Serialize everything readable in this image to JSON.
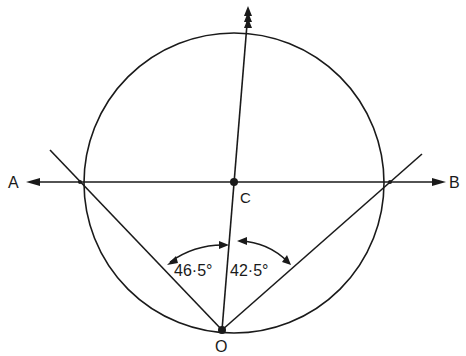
{
  "diagram": {
    "type": "geometry",
    "labels": {
      "A": "A",
      "B": "B",
      "C": "C",
      "O": "O"
    },
    "angles": {
      "left": "46·5°",
      "right": "42·5°"
    },
    "colors": {
      "ink": "#1a1a1a",
      "background": "#ffffff"
    },
    "elements": [
      {
        "kind": "circle",
        "name": "circle",
        "center": "C"
      },
      {
        "kind": "line",
        "name": "horizontal-line-AB",
        "from": "A",
        "to": "B"
      },
      {
        "kind": "line",
        "name": "line-O-through-C",
        "from": "O",
        "through": "C"
      },
      {
        "kind": "line",
        "name": "left-chord-line",
        "from": "O",
        "angle_from_OC": "46·5°"
      },
      {
        "kind": "line",
        "name": "right-chord-line",
        "from": "O",
        "angle_from_OC": "42·5°"
      }
    ]
  }
}
